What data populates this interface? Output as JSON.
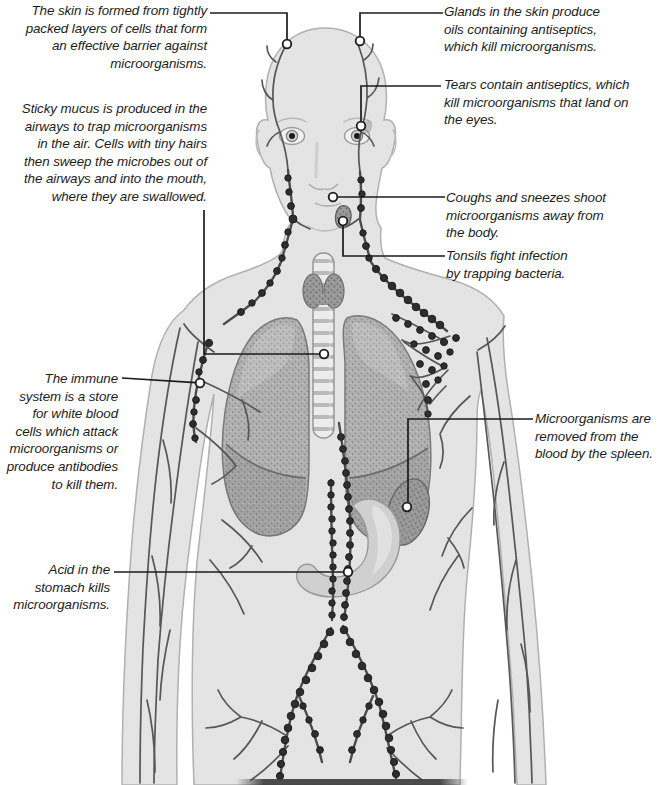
{
  "figure": {
    "kind": "annotated anatomical diagram",
    "depicted_parts": [
      "human-body",
      "lymphatic-vessels",
      "lymph-nodes",
      "eyes",
      "trachea",
      "thyroid",
      "lungs",
      "stomach",
      "spleen"
    ]
  },
  "colors": {
    "background": "#ffffff",
    "body_fill": "#e4e4e4",
    "body_outline": "#b0b0b0",
    "vessel": "#4d4d4d",
    "lymph_node": "#2e2e2e",
    "lung_fill": "#b2b2b2",
    "organ_dark_fill": "#9c9c9c",
    "stomach_fill": "#d0d0d0",
    "leader_line": "#1b1b1b",
    "label_text": "#1c1c1c"
  },
  "labels": {
    "skin": {
      "text": "The skin is formed from tightly\npacked layers of cells that form\nan effective barrier against\nmicroorganisms."
    },
    "glands": {
      "text": "Glands in the skin produce\noils containing antiseptics,\nwhich kill microorganisms."
    },
    "tears": {
      "text": "Tears contain antiseptics, which\nkill microorganisms that land on\nthe eyes."
    },
    "mucus": {
      "text": "Sticky mucus is produced in the\nairways to trap microorganisms\nin the air. Cells with tiny hairs\nthen sweep the microbes out of\nthe airways and into the mouth,\nwhere they are swallowed."
    },
    "coughs": {
      "text": "Coughs and sneezes shoot\nmicroorganisms away from\nthe body."
    },
    "tonsils": {
      "text": "Tonsils fight infection\nby trapping bacteria."
    },
    "immune": {
      "text": "The immune\nsystem is a store\nfor white blood\ncells which attack\nmicroorganisms or\nproduce antibodies\nto kill them."
    },
    "spleen": {
      "text": "Microorganisms are\nremoved from the\nblood by the spleen."
    },
    "acid": {
      "text": "Acid in the\nstomach kills\nmicroorganisms."
    }
  }
}
